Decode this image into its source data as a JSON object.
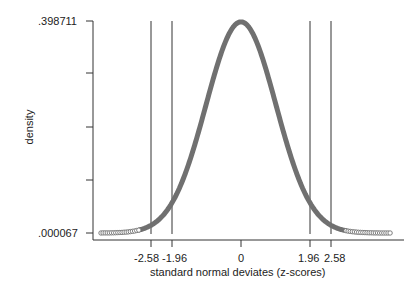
{
  "chart_data": {
    "type": "line",
    "title": "",
    "xlabel": "standard normal deviates (z-scores)",
    "ylabel": "density",
    "series": [
      {
        "name": "standard normal density",
        "function": "normal_pdf",
        "mean": 0,
        "sd": 1,
        "x_range": [
          -4.0,
          4.3
        ]
      }
    ],
    "x_tick_labels": [
      "-2.58",
      "-1.96",
      "0",
      "1.96",
      "2.58"
    ],
    "x_ticks": [
      -2.58,
      -1.96,
      0,
      1.96,
      2.58
    ],
    "y_tick_labels": [
      ".398711",
      "",
      "",
      "",
      ".000067"
    ],
    "y_ticks": [
      0.398711,
      0.299,
      0.199,
      0.1,
      6.7e-05
    ],
    "ylim": [
      6.7e-05,
      0.398711
    ],
    "xlim": [
      -4.2,
      4.6
    ],
    "reference_lines_x": [
      -2.58,
      -1.96,
      1.96,
      2.58
    ],
    "grid": false,
    "legend": "none"
  },
  "labels": {
    "y_top": ".398711",
    "y_bottom": ".000067",
    "ylabel": "density",
    "xlabel": "standard normal deviates (z-scores)",
    "x_ticks": [
      "-2.58",
      "-1.96",
      "0",
      "1.96",
      "2.58"
    ]
  },
  "colors": {
    "curve": "#707070",
    "axis": "#333333",
    "ref_line": "#333333"
  }
}
